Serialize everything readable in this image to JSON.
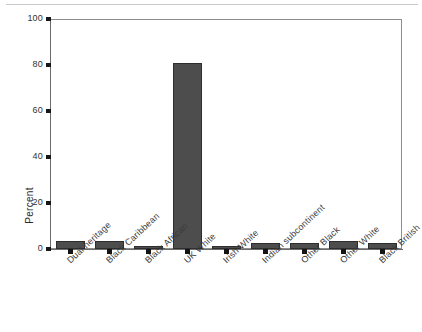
{
  "chart_data": {
    "type": "bar",
    "title": "",
    "xlabel": "",
    "ylabel": "Percent",
    "ylim": [
      0,
      100
    ],
    "yticks": [
      0,
      20,
      40,
      60,
      80,
      100
    ],
    "grid": false,
    "legend": null,
    "categories": [
      "Dual heritage",
      "Black Caribbean",
      "Black African",
      "UK White",
      "Irish White",
      "Indian subcontinent",
      "Other Black",
      "Other White",
      "Black British"
    ],
    "values": [
      3.3,
      3.3,
      1.0,
      81.0,
      1.0,
      2.5,
      2.6,
      3.5,
      2.5
    ],
    "bar_color": "#4d4d4d",
    "bar_edge_color": "#2e2e2e",
    "axis_color": "#6b6b6b"
  },
  "axis": {
    "y_label": "Percent",
    "y_ticks": [
      "0",
      "20",
      "40",
      "60",
      "80",
      "100"
    ]
  }
}
